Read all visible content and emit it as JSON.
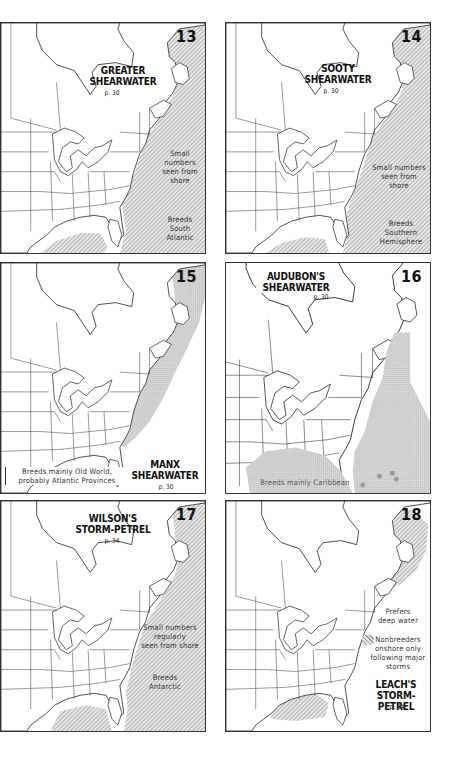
{
  "page": {
    "background": "#ffffff",
    "hatch_color": "#9a9a9a",
    "stipple_color": "#c8c8c8"
  },
  "maps": [
    {
      "number": "13",
      "species_line1": "GREATER",
      "species_line2": "SHEARWATER",
      "page_ref": "p. 30",
      "notes": [
        "Small numbers seen from shore",
        "Breeds South Atlantic"
      ],
      "note1_lines": [
        "Small",
        "numbers",
        "seen from",
        "shore"
      ],
      "note2_lines": [
        "Breeds",
        "South",
        "Atlantic"
      ],
      "range_style": "hatched"
    },
    {
      "number": "14",
      "species_line1": "SOOTY",
      "species_line2": "SHEARWATER",
      "page_ref": "p. 30",
      "notes": [
        "Small numbers seen from shore",
        "Breeds Southern Hemisphere"
      ],
      "note1_lines": [
        "Small numbers",
        "seen from",
        "shore"
      ],
      "note2_lines": [
        "Breeds",
        "Southern",
        "Hemisphere"
      ],
      "range_style": "hatched"
    },
    {
      "number": "15",
      "species_line1": "MANX",
      "species_line2": "SHEARWATER",
      "page_ref": "p. 30",
      "notes": [
        "Breeds mainly Old World, probably Atlantic Provinces"
      ],
      "note1_lines": [
        "Breeds mainly Old World,",
        "probably Atlantic Provinces"
      ],
      "range_style": "stippled"
    },
    {
      "number": "16",
      "species_line1": "AUDUBON'S",
      "species_line2": "SHEARWATER",
      "page_ref": "p. 30",
      "notes": [
        "Breeds mainly Caribbean"
      ],
      "note1_lines": [
        "Breeds mainly Caribbean"
      ],
      "range_style": "stippled"
    },
    {
      "number": "17",
      "species_line1": "WILSON'S",
      "species_line2": "STORM-PETREL",
      "page_ref": "p. 34",
      "notes": [
        "Small numbers regularly seen from shore",
        "Breeds Antarctic"
      ],
      "note1_lines": [
        "Small numbers",
        "regularly",
        "seen from shore"
      ],
      "note2_lines": [
        "Breeds",
        "Antarctic"
      ],
      "range_style": "hatched"
    },
    {
      "number": "18",
      "species_line1": "LEACH'S",
      "species_line2": "STORM-PETREL",
      "page_ref": "p. 34",
      "notes": [
        "Prefers deep water",
        "Nonbreeders onshore only following major storms"
      ],
      "note1_lines": [
        "Prefers",
        "deep water"
      ],
      "note2_lines": [
        "Nonbreeders",
        "onshore only",
        "following major",
        "storms"
      ],
      "range_style": "hatched"
    }
  ]
}
